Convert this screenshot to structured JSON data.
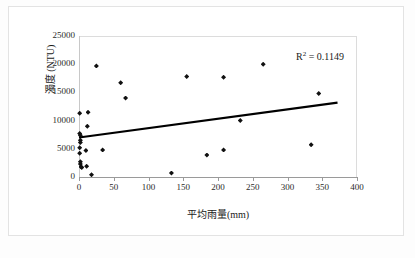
{
  "chart_data": {
    "type": "scatter",
    "title": "",
    "xlabel": "平均雨量(mm)",
    "ylabel": "濁度 (NTU)",
    "xlim": [
      0,
      400
    ],
    "ylim": [
      0,
      25000
    ],
    "xticks": [
      0,
      50,
      100,
      150,
      200,
      250,
      300,
      350,
      400
    ],
    "yticks": [
      0,
      5000,
      10000,
      15000,
      20000,
      25000
    ],
    "xtick_labels": [
      "0",
      "50",
      "100",
      "150",
      "200",
      "250",
      "300",
      "350",
      "400"
    ],
    "ytick_labels": [
      "0",
      "5000",
      "10000",
      "15000",
      "20000",
      "25000"
    ],
    "grid": false,
    "legend": false,
    "marker_color": "#111111",
    "trendline_color": "#000000",
    "annotations": [
      {
        "name": "r-squared",
        "text_prefix": "R",
        "text_sup": "2",
        "text_suffix": " = 0.1149",
        "value": 0.1149
      }
    ],
    "points": [
      {
        "x": 1,
        "y": 11300
      },
      {
        "x": 1,
        "y": 7700
      },
      {
        "x": 2,
        "y": 7400
      },
      {
        "x": 2,
        "y": 6500
      },
      {
        "x": 2,
        "y": 6100
      },
      {
        "x": 1,
        "y": 5200
      },
      {
        "x": 1,
        "y": 4200
      },
      {
        "x": 2,
        "y": 2700
      },
      {
        "x": 2,
        "y": 2300
      },
      {
        "x": 3,
        "y": 1800
      },
      {
        "x": 4,
        "y": 1700
      },
      {
        "x": 13,
        "y": 11500
      },
      {
        "x": 12,
        "y": 9000
      },
      {
        "x": 10,
        "y": 4700
      },
      {
        "x": 11,
        "y": 1900
      },
      {
        "x": 18,
        "y": 400
      },
      {
        "x": 25,
        "y": 19700
      },
      {
        "x": 34,
        "y": 4800
      },
      {
        "x": 60,
        "y": 16700
      },
      {
        "x": 67,
        "y": 14000
      },
      {
        "x": 133,
        "y": 700
      },
      {
        "x": 155,
        "y": 17800
      },
      {
        "x": 184,
        "y": 3900
      },
      {
        "x": 208,
        "y": 17700
      },
      {
        "x": 208,
        "y": 4800
      },
      {
        "x": 232,
        "y": 10000
      },
      {
        "x": 265,
        "y": 20000
      },
      {
        "x": 334,
        "y": 5700
      },
      {
        "x": 345,
        "y": 14800
      }
    ],
    "trendline": {
      "x_start": 0,
      "y_start": 7000,
      "x_end": 372,
      "y_end": 13200
    }
  }
}
